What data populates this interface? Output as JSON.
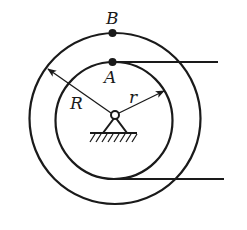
{
  "diagram": {
    "type": "mechanics-stepped-pulley",
    "labels": {
      "point_b": "B",
      "point_a": "A",
      "outer_radius": "R",
      "inner_radius": "r"
    },
    "colors": {
      "stroke": "#1a1a1a",
      "background": "#ffffff"
    },
    "elements": [
      "outer-circle (radius R)",
      "inner-circle (radius r)",
      "point B on outer circle top",
      "point A on inner circle top",
      "top rope tangent at A extending right",
      "bottom rope tangent at inner circle bottom extending right",
      "pin support with hatched ground"
    ]
  }
}
